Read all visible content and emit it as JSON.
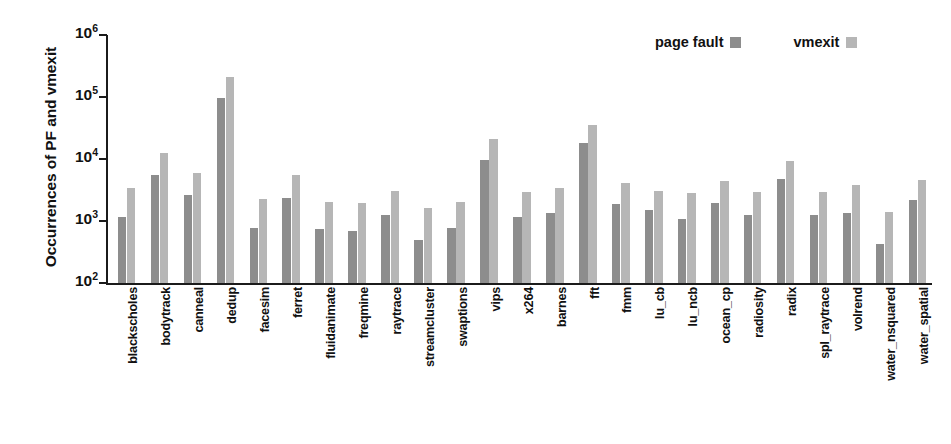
{
  "chart_data": {
    "type": "bar",
    "title": "",
    "xlabel": "",
    "ylabel": "Occurrences of PF and vmexit",
    "yscale": "log",
    "ylim": [
      100,
      1000000
    ],
    "ytick_labels": [
      "10^6",
      "10^5",
      "10^4",
      "10^3",
      "10^2"
    ],
    "ytick_values": [
      1000000,
      100000,
      10000,
      1000,
      100
    ],
    "grid": false,
    "legend_position": "top-right",
    "categories": [
      "blackscholes",
      "bodytrack",
      "canneal",
      "dedup",
      "facesim",
      "ferret",
      "fluidanimate",
      "freqmine",
      "raytrace",
      "streamcluster",
      "swaptions",
      "vips",
      "x264",
      "barnes",
      "fft",
      "fmm",
      "lu_cb",
      "lu_ncb",
      "ocean_cp",
      "radiosity",
      "radix",
      "spl_raytrace",
      "volrend",
      "water_nsquared",
      "water_spatial"
    ],
    "series": [
      {
        "name": "page fault",
        "color": "#8d8d8d",
        "values": [
          1150,
          5500,
          2600,
          98000,
          760,
          2350,
          730,
          690,
          1250,
          490,
          770,
          9800,
          1150,
          1330,
          18000,
          1850,
          1480,
          1060,
          1950,
          1250,
          4700,
          1270,
          1350,
          430,
          2150
        ]
      },
      {
        "name": "vmexit",
        "color": "#b6b6b6",
        "values": [
          3400,
          12500,
          5900,
          210000,
          2250,
          5600,
          2000,
          1950,
          3100,
          1600,
          2000,
          21000,
          2950,
          3400,
          36000,
          4100,
          3000,
          2800,
          4400,
          2950,
          9200,
          2950,
          3850,
          1380,
          4600
        ]
      }
    ]
  },
  "legend": {
    "entries": [
      {
        "label": "page fault",
        "swatch": "page-fault-swatch"
      },
      {
        "label": "vmexit",
        "swatch": "vmexit-swatch"
      }
    ]
  },
  "axis": {
    "y_title": "Occurrences of PF and vmexit",
    "y_ticks": [
      {
        "mantissa": "10",
        "exponent": "6"
      },
      {
        "mantissa": "10",
        "exponent": "5"
      },
      {
        "mantissa": "10",
        "exponent": "4"
      },
      {
        "mantissa": "10",
        "exponent": "3"
      },
      {
        "mantissa": "10",
        "exponent": "2"
      }
    ]
  },
  "colors": {
    "page_fault": "#8d8d8d",
    "vmexit": "#b6b6b6",
    "axis": "#1b1b1b",
    "background": "#ffffff"
  }
}
